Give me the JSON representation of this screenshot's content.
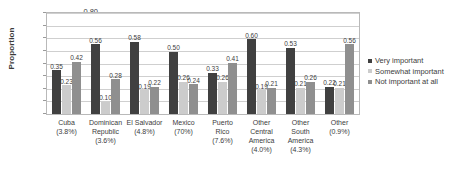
{
  "chart_data": {
    "type": "bar",
    "title": "",
    "xlabel": "",
    "ylabel": "Proportion",
    "ylim": [
      0,
      0.8
    ],
    "ytick_step": 0.1,
    "yticks": [
      "0.80",
      "0.70",
      "0.60",
      "0.50",
      "0.40",
      "0.30",
      "0.20",
      "0.10",
      "0.00"
    ],
    "grid": true,
    "legend_position": "right",
    "categories": [
      "Cuba (3.8%)",
      "Dominican Republic (3.6%)",
      "El Salvador (4.8%)",
      "Mexico (70%)",
      "Puerto Rico (7.6%)",
      "Other Central America (4.0%)",
      "Other South America (4.3%)",
      "Other (0.9%)"
    ],
    "category_lines": [
      [
        "Cuba",
        "(3.8%)"
      ],
      [
        "Dominican",
        "Republic",
        "(3.6%)"
      ],
      [
        "El Salvador",
        "(4.8%)"
      ],
      [
        "Mexico",
        "(70%)"
      ],
      [
        "Puerto",
        "Rico",
        "(7.6%)"
      ],
      [
        "Other",
        "Central",
        "America",
        "(4.0%)"
      ],
      [
        "Other",
        "South",
        "America",
        "(4.3%)"
      ],
      [
        "Other",
        "(0.9%)"
      ]
    ],
    "series": [
      {
        "name": "Very important",
        "color": "#404040",
        "values": [
          0.35,
          0.56,
          0.58,
          0.5,
          0.33,
          0.6,
          0.53,
          0.22
        ],
        "labels": [
          "0.35",
          "0.56",
          "0.58",
          "0.50",
          "0.33",
          "0.60",
          "0.53",
          "0.22"
        ]
      },
      {
        "name": "Somewhat important",
        "color": "#cccccc",
        "values": [
          0.23,
          0.1,
          0.19,
          0.26,
          0.26,
          0.19,
          0.21,
          0.21
        ],
        "labels": [
          "0.23",
          "0.10",
          "0.19",
          "0.26",
          "0.26",
          "0.19",
          "0.21",
          "0.21"
        ]
      },
      {
        "name": "Not important at all",
        "color": "#8f8f8f",
        "values": [
          0.42,
          0.28,
          0.22,
          0.24,
          0.41,
          0.21,
          0.26,
          0.56
        ],
        "labels": [
          "0.42",
          "0.28",
          "0.22",
          "0.24",
          "0.41",
          "0.21",
          "0.26",
          "0.56"
        ]
      }
    ]
  },
  "legend": {
    "items": [
      {
        "label": "Very important"
      },
      {
        "label": "Somewhat important"
      },
      {
        "label": "Not important at all"
      }
    ]
  }
}
